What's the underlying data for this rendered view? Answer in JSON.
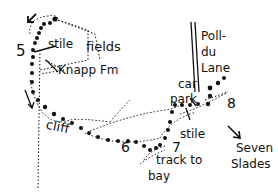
{
  "map": {
    "labels": {
      "stile_top": "stile",
      "fields": "fields",
      "knapp_fm": "Knapp Fm",
      "poll_du_lane_1": "Poll-",
      "poll_du_lane_2": "du",
      "poll_du_lane_3": "Lane",
      "car_park_1": "car",
      "car_park_2": "park",
      "stile_bottom": "stile",
      "cliff": "cliff",
      "track_to_bay_1": "track to",
      "track_to_bay_2": "bay",
      "seven_slades_1": "Seven",
      "seven_slades_2": "Slades"
    },
    "waypoints": [
      "5",
      "6",
      "7",
      "8"
    ],
    "colors": {
      "ink": "#111111",
      "background": "#ffffff"
    }
  }
}
